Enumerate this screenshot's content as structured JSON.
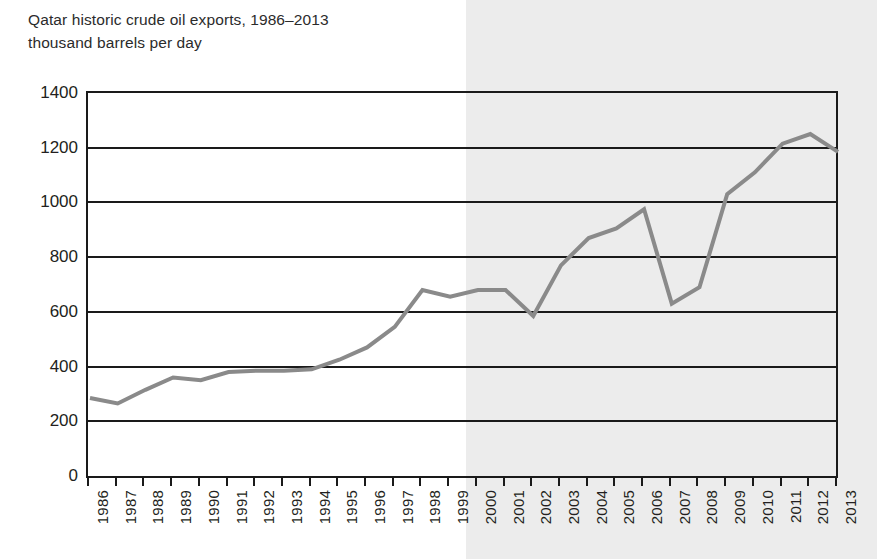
{
  "chart_data": {
    "type": "line",
    "title": "Qatar historic crude oil exports, 1986–2013",
    "subtitle": "thousand barrels per day",
    "xlabel": "",
    "ylabel": "",
    "ylim": [
      0,
      1400
    ],
    "ytick_values": [
      0,
      200,
      400,
      600,
      800,
      1000,
      1200,
      1400
    ],
    "ytick_labels": [
      "0",
      "200",
      "400",
      "600",
      "800",
      "1000",
      "1200",
      "1400"
    ],
    "grid": true,
    "legend": "none",
    "line_color": "#8a8a8a",
    "axis_color": "#1a1a1a",
    "shaded_region": {
      "label": "",
      "color": "#ececec",
      "from_x_pixel": 466,
      "start_year": 2000,
      "end_year": 2013
    },
    "categories": [
      "1986",
      "1987",
      "1988",
      "1989",
      "1990",
      "1991",
      "1992",
      "1993",
      "1994",
      "1995",
      "1996",
      "1997",
      "1998",
      "1999",
      "2000",
      "2001",
      "2002",
      "2003",
      "2004",
      "2005",
      "2006",
      "2007",
      "2008",
      "2009",
      "2010",
      "2011",
      "2012",
      "2013"
    ],
    "x": [
      1986,
      1987,
      1988,
      1989,
      1990,
      1991,
      1992,
      1993,
      1994,
      1995,
      1996,
      1997,
      1998,
      1999,
      2000,
      2001,
      2002,
      2003,
      2004,
      2005,
      2006,
      2007,
      2008,
      2009,
      2010,
      2011,
      2012,
      2013
    ],
    "values": [
      285,
      265,
      315,
      360,
      350,
      380,
      385,
      385,
      390,
      425,
      470,
      545,
      680,
      655,
      680,
      680,
      585,
      770,
      870,
      905,
      975,
      630,
      690,
      1030,
      1110,
      1215,
      1250,
      1185
    ],
    "series": [
      {
        "name": "Qatar crude oil exports",
        "color": "#8a8a8a",
        "values": [
          285,
          265,
          315,
          360,
          350,
          380,
          385,
          385,
          390,
          425,
          470,
          545,
          680,
          655,
          680,
          680,
          585,
          770,
          870,
          905,
          975,
          630,
          690,
          1030,
          1110,
          1215,
          1250,
          1185
        ]
      }
    ]
  }
}
